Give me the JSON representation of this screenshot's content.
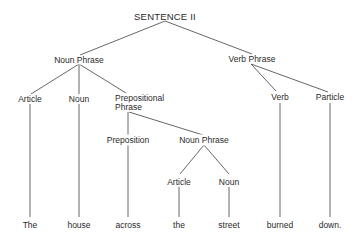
{
  "diagram": {
    "type": "parse-tree",
    "title": "SENTENCE II",
    "nodes": {
      "root": {
        "label": "SENTENCE II"
      },
      "np1": {
        "label": "Noun Phrase"
      },
      "vp": {
        "label": "Verb Phrase"
      },
      "art1": {
        "label": "Article"
      },
      "noun1": {
        "label": "Noun"
      },
      "pp": {
        "label": "Prepositional",
        "label2": "Phrase"
      },
      "verb": {
        "label": "Verb"
      },
      "particle": {
        "label": "Particle"
      },
      "prep": {
        "label": "Preposition"
      },
      "np2": {
        "label": "Noun Phrase"
      },
      "art2": {
        "label": "Article"
      },
      "noun2": {
        "label": "Noun"
      }
    },
    "leaves": [
      "The",
      "house",
      "across",
      "the",
      "street",
      "burned",
      "down."
    ],
    "edges": [
      [
        "root",
        "np1"
      ],
      [
        "root",
        "vp"
      ],
      [
        "np1",
        "art1"
      ],
      [
        "np1",
        "noun1"
      ],
      [
        "np1",
        "pp"
      ],
      [
        "vp",
        "verb"
      ],
      [
        "vp",
        "particle"
      ],
      [
        "pp",
        "prep"
      ],
      [
        "pp",
        "np2"
      ],
      [
        "np2",
        "art2"
      ],
      [
        "np2",
        "noun2"
      ],
      [
        "art1",
        "The"
      ],
      [
        "noun1",
        "house"
      ],
      [
        "prep",
        "across"
      ],
      [
        "art2",
        "the"
      ],
      [
        "noun2",
        "street"
      ],
      [
        "verb",
        "burned"
      ],
      [
        "particle",
        "down."
      ]
    ]
  }
}
